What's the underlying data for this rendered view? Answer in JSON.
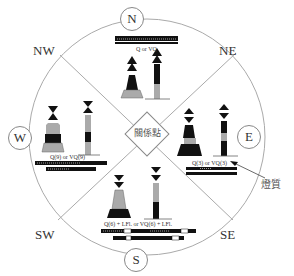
{
  "center_label": "關係點",
  "cardinals": {
    "N": "N",
    "E": "E",
    "S": "S",
    "W": "W"
  },
  "intercardinals": {
    "NW": "NW",
    "NE": "NE",
    "SW": "SW",
    "SE": "SE"
  },
  "marks": {
    "north": {
      "light_character": "Q or VQ",
      "topmark": "two cones pointing up",
      "colors": "black above yellow"
    },
    "east": {
      "light_character": "Q(3) or VQ(3)",
      "topmark": "two cones base to base",
      "colors": "black with yellow band"
    },
    "south": {
      "light_character": "Q(6) + LFl. or VQ(6) + LFl.",
      "topmark": "two cones pointing down",
      "colors": "yellow above black"
    },
    "west": {
      "light_character": "Q(9) or VQ(9)",
      "topmark": "two cones point to point",
      "colors": "yellow with black band"
    }
  },
  "annotation": "燈質",
  "colors": {
    "black": "#111111",
    "yellow_gray": "#aaaaaa",
    "line": "#999999"
  }
}
